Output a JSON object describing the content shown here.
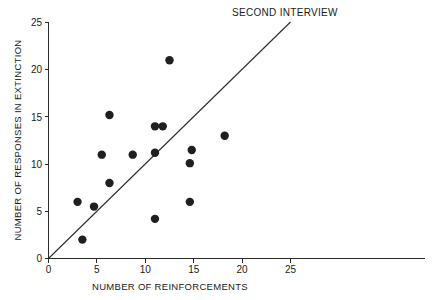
{
  "chart_data": {
    "type": "scatter",
    "title": "SECOND INTERVIEW",
    "xlabel": "NUMBER OF REINFORCEMENTS",
    "ylabel": "NUMBER OF RESPONSES IN EXTINCTION",
    "xlim": [
      0,
      25
    ],
    "ylim": [
      0,
      25
    ],
    "xticks": [
      0,
      5,
      10,
      15,
      20,
      25
    ],
    "yticks": [
      0,
      5,
      10,
      15,
      20,
      25
    ],
    "xtick_labels": [
      "0",
      "5",
      "10",
      "15",
      "20",
      "25"
    ],
    "ytick_labels": [
      "0",
      "5",
      "10",
      "15",
      "20",
      "25"
    ],
    "grid": false,
    "legend": null,
    "marker": "filled-circle",
    "marker_color": "#1f1f1f",
    "marker_size": 4.2,
    "points": [
      {
        "x": 3.0,
        "y": 6.0
      },
      {
        "x": 3.5,
        "y": 2.0
      },
      {
        "x": 4.7,
        "y": 5.5
      },
      {
        "x": 5.5,
        "y": 11.0
      },
      {
        "x": 6.3,
        "y": 15.2
      },
      {
        "x": 6.3,
        "y": 8.0
      },
      {
        "x": 8.7,
        "y": 11.0
      },
      {
        "x": 11.0,
        "y": 14.0
      },
      {
        "x": 11.8,
        "y": 14.0
      },
      {
        "x": 11.0,
        "y": 11.2
      },
      {
        "x": 11.0,
        "y": 4.2
      },
      {
        "x": 12.5,
        "y": 21.0
      },
      {
        "x": 14.8,
        "y": 11.5
      },
      {
        "x": 14.6,
        "y": 10.1
      },
      {
        "x": 14.6,
        "y": 6.0
      },
      {
        "x": 18.2,
        "y": 13.0
      }
    ],
    "reference_line": {
      "name": "identity-line",
      "from": {
        "x": 0,
        "y": 0
      },
      "to": {
        "x": 25,
        "y": 25
      },
      "color": "#2b2b2b"
    },
    "axis_color": "#2b2b2b",
    "background_color": "#ffffff",
    "x_axis_extends_to": 39.0
  }
}
